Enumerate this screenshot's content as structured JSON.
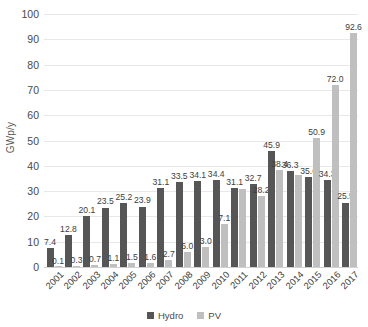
{
  "chart_data": {
    "type": "bar",
    "title": "",
    "xlabel": "",
    "ylabel": "GWp/y",
    "ylim": [
      0,
      100
    ],
    "ytick_step": 10,
    "yticks": [
      "0",
      "10",
      "20",
      "30",
      "40",
      "50",
      "60",
      "70",
      "80",
      "90",
      "100"
    ],
    "grid": true,
    "legend_position": "bottom-center",
    "categories": [
      "2001",
      "2002",
      "2003",
      "2004",
      "2005",
      "2006",
      "2007",
      "2008",
      "2009",
      "2010",
      "2011",
      "2012",
      "2013",
      "2014",
      "2015",
      "2016",
      "2017"
    ],
    "series": [
      {
        "name": "Hydro",
        "color": "#565656",
        "values": [
          7.4,
          12.8,
          20.1,
          23.5,
          25.2,
          23.9,
          31.1,
          33.5,
          34.1,
          34.4,
          31.1,
          32.7,
          45.9,
          38.0,
          35.6,
          34.3,
          25.5
        ],
        "labels": [
          "7.4",
          "12.8",
          "20.1",
          "23.5",
          "25.2",
          "23.9",
          "31.1",
          "33.5",
          "34.1",
          "34.4",
          "31.1",
          "32.7",
          "45.9",
          "36.3",
          "35.6",
          "34.3",
          "25.5"
        ]
      },
      {
        "name": "PV",
        "color": "#bfbfbf",
        "values": [
          0.1,
          0.3,
          0.7,
          1.1,
          1.5,
          1.6,
          2.7,
          6.0,
          8.0,
          17.1,
          30.9,
          28.2,
          38.4,
          36.3,
          50.9,
          72.0,
          92.6
        ],
        "labels": [
          "0.1",
          "0.3",
          "0.7",
          "1.1",
          "1.5",
          "1.6",
          "2.7",
          "6.0",
          "3.0",
          "7.1",
          "",
          "28.2",
          "38.4",
          "",
          "50.9",
          "72.0",
          "92.6"
        ]
      }
    ]
  },
  "legend": {
    "items": [
      {
        "label": "Hydro",
        "color": "#565656",
        "swatch_name": "legend-swatch-hydro"
      },
      {
        "label": "PV",
        "color": "#bfbfbf",
        "swatch_name": "legend-swatch-pv"
      }
    ]
  }
}
